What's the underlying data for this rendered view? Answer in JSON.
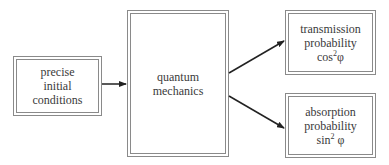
{
  "diagram": {
    "nodes": {
      "initial": {
        "lines": [
          "precise",
          "initial",
          "conditions"
        ]
      },
      "qm": {
        "lines": [
          "quantum",
          "mechanics"
        ]
      },
      "transmission": {
        "lines": [
          "transmission",
          "probability"
        ],
        "formula": "cos",
        "exponent": "2",
        "symbol": "φ"
      },
      "absorption": {
        "lines": [
          "absorption",
          "probability"
        ],
        "formula": "sin",
        "exponent": "2",
        "symbol": "φ"
      }
    },
    "edges": [
      {
        "from": "initial",
        "to": "qm"
      },
      {
        "from": "qm",
        "to": "transmission"
      },
      {
        "from": "qm",
        "to": "absorption"
      }
    ],
    "colors": {
      "line": "#222222",
      "border": "#8a8a8a",
      "text": "#3a3a3a"
    }
  }
}
